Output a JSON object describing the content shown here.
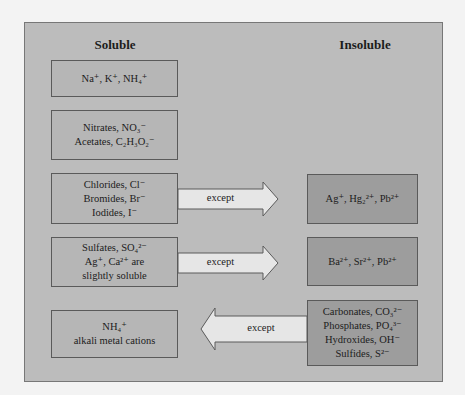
{
  "headings": {
    "soluble": "Soluble",
    "insoluble": "Insoluble"
  },
  "soluble_boxes": [
    {
      "lines": [
        "Na⁺, K⁺, NH₄⁺"
      ]
    },
    {
      "lines": [
        "Nitrates, NO₃⁻",
        "Acetates, C₂H₃O₂⁻"
      ]
    },
    {
      "lines": [
        "Chlorides, Cl⁻",
        "Bromides, Br⁻",
        "Iodides, I⁻"
      ]
    },
    {
      "lines": [
        "Sulfates, SO₄²⁻",
        "Ag⁺, Ca²⁺ are",
        "slightly soluble"
      ]
    },
    {
      "lines": [
        "NH₄⁺",
        "alkali metal cations"
      ]
    }
  ],
  "insoluble_boxes": [
    {
      "lines": [
        "Ag⁺, Hg₂²⁺, Pb²⁺"
      ]
    },
    {
      "lines": [
        "Ba²⁺, Sr²⁺, Pb²⁺"
      ]
    },
    {
      "lines": [
        "Carbonates, CO₃²⁻",
        "Phosphates, PO₄³⁻",
        "Hydroxides, OH⁻",
        "Sulfides, S²⁻"
      ]
    }
  ],
  "arrows": [
    {
      "label": "except",
      "direction": "right"
    },
    {
      "label": "except",
      "direction": "right"
    },
    {
      "label": "except",
      "direction": "left"
    }
  ],
  "colors": {
    "page_bg": "#f3f3f3",
    "panel_bg": "#bcbcbc",
    "soluble_box": "#b6b6b6",
    "insoluble_box": "#9d9d9d",
    "arrow_fill": "#e6e6e6",
    "border": "#5a5a5a"
  }
}
